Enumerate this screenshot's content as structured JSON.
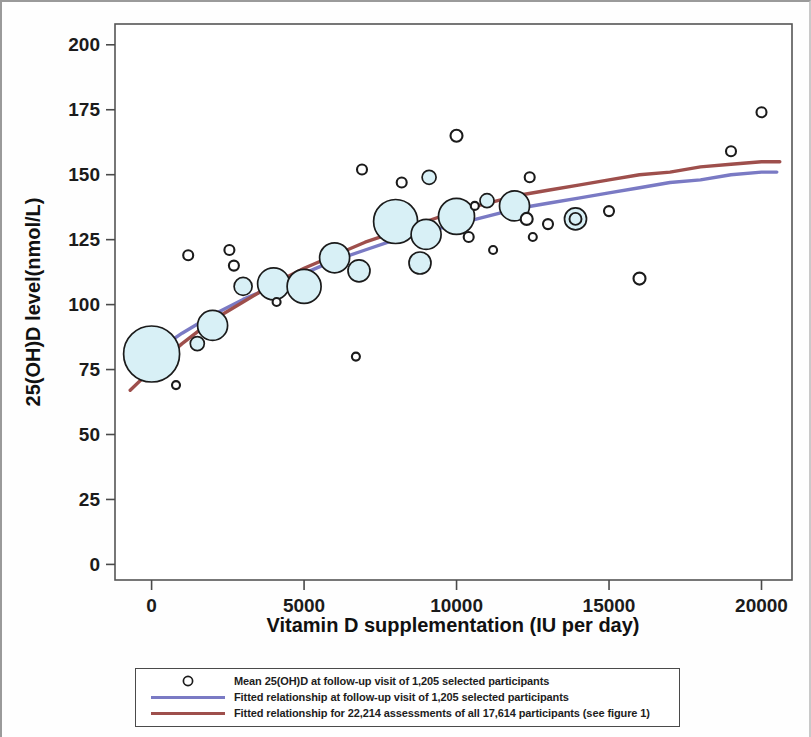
{
  "chart_data": {
    "type": "scatter",
    "title": "",
    "xlabel": "Vitamin D supplementation (IU per day)",
    "ylabel": "25(OH)D level(nmol/L)",
    "xlim": [
      -1200,
      21000
    ],
    "ylim": [
      -6,
      208
    ],
    "xticks": [
      0,
      5000,
      10000,
      15000,
      20000
    ],
    "xticklabels": [
      "0",
      "5000",
      "10000",
      "15000",
      "20000"
    ],
    "yticks": [
      0,
      25,
      50,
      75,
      100,
      125,
      150,
      175,
      200
    ],
    "yticklabels": [
      "0",
      "25",
      "50",
      "75",
      "100",
      "125",
      "150",
      "175",
      "200"
    ],
    "grid": false,
    "legend_position": "below-axes",
    "marker_style": "open circle, light-cyan fill, size proportional to group n",
    "bubbles": [
      {
        "x": 0,
        "y": 81,
        "r": 28
      },
      {
        "x": 800,
        "y": 69,
        "r": 4
      },
      {
        "x": 1200,
        "y": 119,
        "r": 5
      },
      {
        "x": 1500,
        "y": 85,
        "r": 7
      },
      {
        "x": 2000,
        "y": 92,
        "r": 15
      },
      {
        "x": 2550,
        "y": 121,
        "r": 5
      },
      {
        "x": 2700,
        "y": 115,
        "r": 5
      },
      {
        "x": 3000,
        "y": 107,
        "r": 9
      },
      {
        "x": 4000,
        "y": 108,
        "r": 16
      },
      {
        "x": 4100,
        "y": 101,
        "r": 4
      },
      {
        "x": 5000,
        "y": 107,
        "r": 17
      },
      {
        "x": 6000,
        "y": 118,
        "r": 15
      },
      {
        "x": 6700,
        "y": 80,
        "r": 4
      },
      {
        "x": 6800,
        "y": 113,
        "r": 11
      },
      {
        "x": 6900,
        "y": 152,
        "r": 5
      },
      {
        "x": 8000,
        "y": 132,
        "r": 22
      },
      {
        "x": 8200,
        "y": 147,
        "r": 5
      },
      {
        "x": 8800,
        "y": 116,
        "r": 11
      },
      {
        "x": 9000,
        "y": 127,
        "r": 15
      },
      {
        "x": 9100,
        "y": 149,
        "r": 7
      },
      {
        "x": 10000,
        "y": 134,
        "r": 18
      },
      {
        "x": 10000,
        "y": 165,
        "r": 6
      },
      {
        "x": 10400,
        "y": 126,
        "r": 5
      },
      {
        "x": 10600,
        "y": 138,
        "r": 4
      },
      {
        "x": 11000,
        "y": 140,
        "r": 7
      },
      {
        "x": 11200,
        "y": 121,
        "r": 4
      },
      {
        "x": 11900,
        "y": 138,
        "r": 15
      },
      {
        "x": 12300,
        "y": 133,
        "r": 6
      },
      {
        "x": 12400,
        "y": 149,
        "r": 5
      },
      {
        "x": 12500,
        "y": 126,
        "r": 4
      },
      {
        "x": 13000,
        "y": 131,
        "r": 5
      },
      {
        "x": 13900,
        "y": 133,
        "r": 11,
        "double": true
      },
      {
        "x": 15000,
        "y": 136,
        "r": 5
      },
      {
        "x": 16000,
        "y": 110,
        "r": 6
      },
      {
        "x": 19000,
        "y": 159,
        "r": 5
      },
      {
        "x": 20000,
        "y": 174,
        "r": 5
      }
    ],
    "series": [
      {
        "name": "Fitted relationship at follow-up visit of 1,205 selected participants",
        "type": "line",
        "color": "#7a7ac4",
        "points": [
          [
            0,
            81
          ],
          [
            1000,
            89
          ],
          [
            2000,
            96
          ],
          [
            3000,
            102
          ],
          [
            4000,
            107
          ],
          [
            5000,
            112
          ],
          [
            6000,
            117
          ],
          [
            7000,
            121
          ],
          [
            8000,
            125
          ],
          [
            9000,
            128
          ],
          [
            10000,
            131
          ],
          [
            11000,
            134
          ],
          [
            12000,
            137
          ],
          [
            13000,
            139
          ],
          [
            14000,
            141
          ],
          [
            15000,
            143
          ],
          [
            16000,
            145
          ],
          [
            17000,
            147
          ],
          [
            18000,
            148
          ],
          [
            19000,
            150
          ],
          [
            20000,
            151
          ],
          [
            20500,
            151
          ]
        ]
      },
      {
        "name": "Fitted relationship for 22,214 assessments of all 17,614 participants (see figure 1)",
        "type": "line",
        "color": "#9e4f4c",
        "points": [
          [
            -700,
            67
          ],
          [
            0,
            75
          ],
          [
            1000,
            85
          ],
          [
            2000,
            94
          ],
          [
            3000,
            101
          ],
          [
            4000,
            108
          ],
          [
            5000,
            114
          ],
          [
            6000,
            119
          ],
          [
            7000,
            124
          ],
          [
            8000,
            128
          ],
          [
            9000,
            132
          ],
          [
            10000,
            136
          ],
          [
            11000,
            139
          ],
          [
            12000,
            142
          ],
          [
            13000,
            144
          ],
          [
            14000,
            146
          ],
          [
            15000,
            148
          ],
          [
            16000,
            150
          ],
          [
            17000,
            151
          ],
          [
            18000,
            153
          ],
          [
            19000,
            154
          ],
          [
            20000,
            155
          ],
          [
            20600,
            155
          ]
        ]
      }
    ]
  },
  "legend": {
    "rows": [
      {
        "key": "open-circle-marker",
        "label": "Mean 25(OH)D at follow-up visit of 1,205 selected participants",
        "color": "#1b1b1b"
      },
      {
        "key": "blue-line",
        "label": "Fitted relationship at follow-up visit of 1,205 selected participants",
        "color": "#7a7ac4"
      },
      {
        "key": "red-line",
        "label": "Fitted relationship for 22,214 assessments of all 17,614 participants (see figure 1)",
        "color": "#9e4f4c"
      }
    ]
  },
  "colors": {
    "bubble_fill": "#d8f0f6",
    "bubble_stroke": "#1b1b1b",
    "blue_line": "#7a7ac4",
    "red_line": "#9e4f4c",
    "axis": "#4a4a4a",
    "text": "#1b1b1b"
  }
}
